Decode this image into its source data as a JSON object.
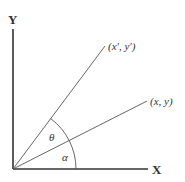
{
  "diagram": {
    "axes": {
      "x_label": "X",
      "y_label": "Y"
    },
    "points": {
      "original": "(x, y)",
      "rotated": "(x′, y′)"
    },
    "angles": {
      "rotation": "θ",
      "original": "α"
    },
    "colors": {
      "line": "#444444",
      "text": "#333333",
      "background": "#ffffff"
    }
  }
}
